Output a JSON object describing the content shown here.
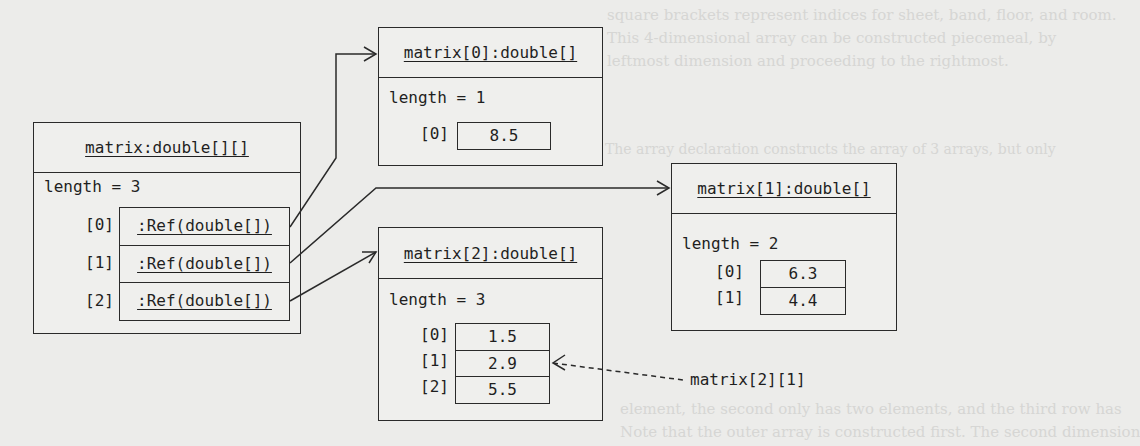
{
  "background_text": [
    "square brackets represent indices for sheet, band, floor, and room.",
    "This 4-dimensional array can be constructed piecemeal, by",
    "leftmost dimension and proceeding to the rightmost.",
    "The array declaration constructs the array of 3 arrays, but only",
    "element, sheet has its own bounds, roomIndex ranges and",
    "matrix [2][1] refers to an array of arrays with elements of",
    "element, the second only has two elements, and the third row has",
    "Note that the outer array is constructed first. The second dimension"
  ],
  "main": {
    "title": "matrix:double[][]",
    "length": "length = 3",
    "entries": [
      {
        "index": "[0]",
        "value": ":Ref(double[])"
      },
      {
        "index": "[1]",
        "value": ":Ref(double[])"
      },
      {
        "index": "[2]",
        "value": ":Ref(double[])"
      }
    ]
  },
  "row0": {
    "title": "matrix[0]:double[]",
    "length": "length = 1",
    "entries": [
      {
        "index": "[0]",
        "value": "8.5"
      }
    ]
  },
  "row1": {
    "title": "matrix[1]:double[]",
    "length": "length = 2",
    "entries": [
      {
        "index": "[0]",
        "value": "6.3"
      },
      {
        "index": "[1]",
        "value": "4.4"
      }
    ]
  },
  "row2": {
    "title": "matrix[2]:double[]",
    "length": "length = 3",
    "entries": [
      {
        "index": "[0]",
        "value": "1.5"
      },
      {
        "index": "[1]",
        "value": "2.9"
      },
      {
        "index": "[2]",
        "value": "5.5"
      }
    ]
  },
  "annotation": {
    "label": "matrix[2][1]",
    "points_to": "row2.entries.1"
  }
}
